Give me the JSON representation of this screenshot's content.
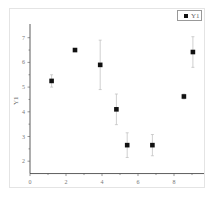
{
  "chart_data": {
    "type": "scatter",
    "title": "",
    "xlabel": "",
    "ylabel": "Y1",
    "xlim": [
      0,
      9.5
    ],
    "ylim": [
      1.5,
      7.5
    ],
    "xticks": [
      0,
      2,
      4,
      6,
      8
    ],
    "yticks": [
      2,
      3,
      4,
      5,
      6,
      7
    ],
    "grid": false,
    "legend_position": "top-right",
    "series": [
      {
        "name": "Y1",
        "marker": "square",
        "color": "#111111",
        "x": [
          1.2,
          2.5,
          3.9,
          4.8,
          5.4,
          6.8,
          8.55,
          9.05
        ],
        "y": [
          5.25,
          6.5,
          5.9,
          4.1,
          2.65,
          2.65,
          4.62,
          6.42
        ],
        "yerr": [
          0.25,
          0.05,
          1.0,
          0.62,
          0.5,
          0.43,
          0.1,
          0.62
        ]
      }
    ]
  },
  "legend": {
    "label": "Y1"
  },
  "axes": {
    "ylabel": "Y1",
    "xtick_labels": [
      "0",
      "2",
      "4",
      "6",
      "8"
    ],
    "ytick_labels": [
      "2",
      "3",
      "4",
      "5",
      "6",
      "7"
    ]
  }
}
